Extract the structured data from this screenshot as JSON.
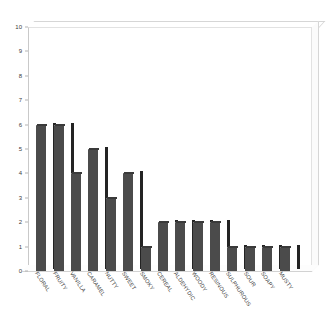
{
  "chart_data": {
    "type": "bar",
    "title": "",
    "subtitle": "",
    "xlabel": "",
    "ylabel": "",
    "ylim": [
      0,
      10
    ],
    "ytick_step": 1,
    "grid": false,
    "legend": false,
    "legend_position": "none",
    "orientation": "vertical",
    "style_3d": true,
    "bar_color": "#4b4b4b",
    "bar_side_color": "#232323",
    "background_color": "#ffffff",
    "axis_color": "#c9c9c9",
    "tick_label_color": "#3a3a3a",
    "categories": [
      "FLORAL",
      "FRUITY",
      "VANILLA",
      "CARAMEL",
      "NUTTY",
      "SWEET",
      "SMOKY",
      "CEREAL",
      "ALDEHYDIC",
      "WOODY",
      "RESINOUS",
      "SULPHUROUS",
      "SOUR",
      "SOAPY",
      "MUSTY"
    ],
    "values": [
      6,
      6,
      4,
      5,
      3,
      4,
      1,
      2,
      2,
      2,
      2,
      1,
      1,
      1,
      1
    ],
    "ytick_labels": [
      "0",
      "1",
      "2",
      "3",
      "4",
      "5",
      "6",
      "7",
      "8",
      "9",
      "10"
    ],
    "ytick_values": [
      0,
      1,
      2,
      3,
      4,
      5,
      6,
      7,
      8,
      9,
      10
    ]
  }
}
